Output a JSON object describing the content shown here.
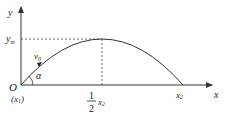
{
  "diagram": {
    "type": "projectile-trajectory",
    "axes": {
      "x_label": "x",
      "y_label": "y"
    },
    "labels": {
      "origin": "O",
      "origin_sub": "(x",
      "origin_sub_index": "1",
      "origin_sub_close": ")",
      "y_max": "y",
      "y_max_sub": "m",
      "velocity": "v",
      "velocity_sub": "0",
      "angle": "α",
      "half_num": "1",
      "half_den": "2",
      "half_x": "x",
      "half_x_sub": "2",
      "x2": "x",
      "x2_sub": "2"
    },
    "colors": {
      "line": "#333333",
      "text": "#222222"
    }
  }
}
